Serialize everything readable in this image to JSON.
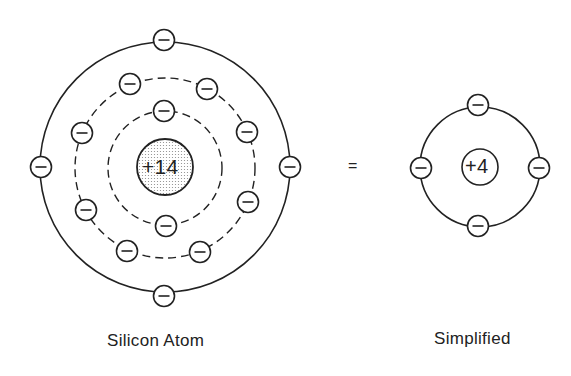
{
  "diagram": {
    "silicon_atom": {
      "caption": "Silicon Atom",
      "nucleus_label": "+14",
      "electron_symbol": "−",
      "shells": [
        {
          "style": "dashed",
          "electrons": 2
        },
        {
          "style": "dashed",
          "electrons": 8
        },
        {
          "style": "solid",
          "electrons": 4
        }
      ]
    },
    "equals_sign": "=",
    "simplified_atom": {
      "caption": "Simplified",
      "nucleus_label": "+4",
      "electron_symbol": "−",
      "shells": [
        {
          "style": "solid",
          "electrons": 4
        }
      ]
    }
  }
}
